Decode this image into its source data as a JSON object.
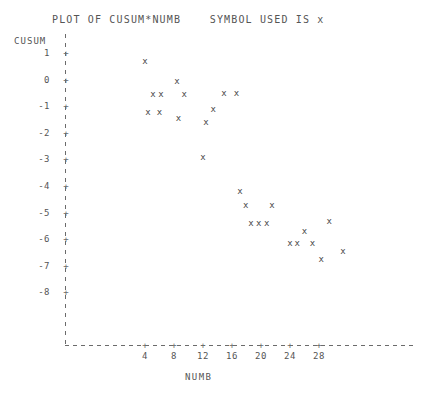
{
  "title": "PLOT OF CUSUM*NUMB    SYMBOL USED IS x",
  "axis": {
    "y_name": "CUSUM",
    "x_name": "NUMB"
  },
  "chart_data": {
    "type": "scatter",
    "title": "PLOT OF CUSUM*NUMB    SYMBOL USED IS x",
    "xlabel": "NUMB",
    "ylabel": "CUSUM",
    "symbol": "x",
    "grid": false,
    "legend": "none",
    "xlim": [
      0,
      32
    ],
    "ylim": [
      -8.5,
      1.2
    ],
    "xticks": [
      4,
      8,
      12,
      16,
      20,
      24,
      28
    ],
    "yticks": [
      1,
      0,
      -1,
      -2,
      -3,
      -4,
      -5,
      -6,
      -7,
      -8
    ],
    "ytick_labels": [
      "1",
      "0",
      "-1",
      "-2",
      "-3",
      "-4",
      "-5",
      "-6",
      "-7",
      "-8"
    ],
    "xtick_labels": [
      "4",
      "8",
      "12",
      "16",
      "20",
      "24",
      "28"
    ],
    "points": [
      {
        "x": 4.0,
        "y": 0.7
      },
      {
        "x": 5.1,
        "y": -0.55
      },
      {
        "x": 6.2,
        "y": -0.55
      },
      {
        "x": 8.4,
        "y": -0.05
      },
      {
        "x": 4.4,
        "y": -1.2
      },
      {
        "x": 6.0,
        "y": -1.2
      },
      {
        "x": 9.4,
        "y": -0.55
      },
      {
        "x": 8.6,
        "y": -1.45
      },
      {
        "x": 13.4,
        "y": -1.1
      },
      {
        "x": 12.4,
        "y": -1.6
      },
      {
        "x": 14.9,
        "y": -0.5
      },
      {
        "x": 16.6,
        "y": -0.5
      },
      {
        "x": 12.0,
        "y": -2.9
      },
      {
        "x": 17.1,
        "y": -4.2
      },
      {
        "x": 17.9,
        "y": -4.7
      },
      {
        "x": 21.5,
        "y": -4.7
      },
      {
        "x": 18.6,
        "y": -5.4
      },
      {
        "x": 19.7,
        "y": -5.4
      },
      {
        "x": 20.8,
        "y": -5.4
      },
      {
        "x": 26.0,
        "y": -5.7
      },
      {
        "x": 24.0,
        "y": -6.15
      },
      {
        "x": 25.0,
        "y": -6.15
      },
      {
        "x": 27.1,
        "y": -6.15
      },
      {
        "x": 29.4,
        "y": -5.3
      },
      {
        "x": 28.3,
        "y": -6.75
      },
      {
        "x": 31.3,
        "y": -6.45
      }
    ]
  }
}
